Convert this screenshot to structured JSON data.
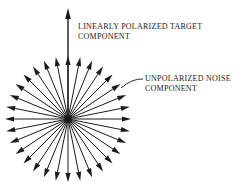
{
  "figure": {
    "background_color": "#ffffff",
    "ink_color": "#1a1a1a",
    "width": 249,
    "height": 190
  },
  "labels": {
    "target": {
      "line1": "LINEARLY POLARIZED TARGET",
      "line2": "COMPONENT"
    },
    "noise": {
      "line1": "UNPOLARIZED NOISE",
      "line2": "COMPONENT"
    }
  },
  "chart_data": {
    "type": "scatter",
    "xlabel": "",
    "ylabel": "",
    "grid": false,
    "legend": "none",
    "center": {
      "x": 68,
      "y": 119
    },
    "noise_starburst": {
      "description": "Unpolarized noise component drawn as an isotropic starburst of equal-length arrows radiating from the origin",
      "ray_count": 32,
      "angle_step_degrees": 11.25,
      "radius_px": 63,
      "arrow_head_length_px": 9,
      "arrow_head_half_width_px": 2.6,
      "stroke_width_px": 1,
      "angles_degrees": [
        0,
        11.25,
        22.5,
        33.75,
        45,
        56.25,
        67.5,
        78.75,
        90,
        101.25,
        112.5,
        123.75,
        135,
        146.25,
        157.5,
        168.75,
        180,
        191.25,
        202.5,
        213.75,
        225,
        236.25,
        247.5,
        258.75,
        270,
        281.25,
        292.5,
        303.75,
        315,
        326.25,
        337.5,
        348.75
      ]
    },
    "target_arrow": {
      "description": "Linearly polarized target component drawn as a single long vertical arrow pointing up from the origin",
      "angle_degrees": 90,
      "length_px": 111,
      "tip": {
        "x": 68,
        "y": 8
      },
      "arrow_head_length_px": 11,
      "arrow_head_half_width_px": 2.8,
      "stroke_width_px": 1.4
    },
    "leader_line": {
      "description": "Curved leader from the noise label to a noise arrowhead",
      "from": {
        "x": 143,
        "y": 79
      },
      "to": {
        "x": 121,
        "y": 88
      }
    }
  }
}
